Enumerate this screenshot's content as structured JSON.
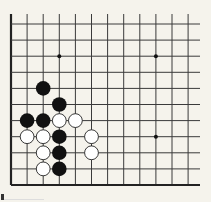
{
  "board": {
    "type": "go-diagram",
    "columns": 12,
    "rows": 11,
    "origin_x": 11,
    "origin_y": 24,
    "spacing_x": 16.1,
    "spacing_y": 16.1,
    "top_line_extend_to": 14,
    "right_line_extend_to": 200,
    "edges": {
      "left": true,
      "bottom": true,
      "top": false,
      "right": false
    },
    "colors": {
      "background": "#f5f3ec",
      "line": "#3a3a3a",
      "edge": "#222222",
      "black_stone": "#111111",
      "white_stone_fill": "#ffffff",
      "white_stone_stroke": "#222222",
      "star_point": "#111111"
    },
    "star_points": [
      {
        "col": 3,
        "row": 2
      },
      {
        "col": 9,
        "row": 2
      },
      {
        "col": 9,
        "row": 7
      }
    ],
    "stones": [
      {
        "color": "black",
        "col": 2,
        "row": 4
      },
      {
        "color": "black",
        "col": 3,
        "row": 5
      },
      {
        "color": "black",
        "col": 1,
        "row": 6
      },
      {
        "color": "black",
        "col": 2,
        "row": 6
      },
      {
        "color": "white",
        "col": 3,
        "row": 6
      },
      {
        "color": "white",
        "col": 4,
        "row": 6
      },
      {
        "color": "white",
        "col": 1,
        "row": 7
      },
      {
        "color": "white",
        "col": 2,
        "row": 7
      },
      {
        "color": "black",
        "col": 3,
        "row": 7
      },
      {
        "color": "white",
        "col": 5,
        "row": 7
      },
      {
        "color": "white",
        "col": 2,
        "row": 8
      },
      {
        "color": "black",
        "col": 3,
        "row": 8
      },
      {
        "color": "white",
        "col": 5,
        "row": 8
      },
      {
        "color": "white",
        "col": 2,
        "row": 9
      },
      {
        "color": "black",
        "col": 3,
        "row": 9
      }
    ]
  }
}
